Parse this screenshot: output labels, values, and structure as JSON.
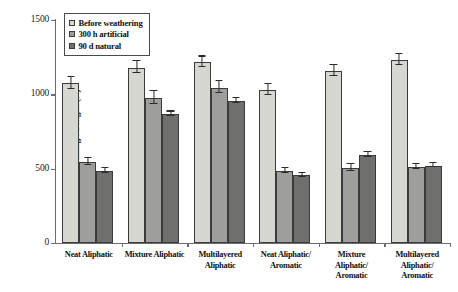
{
  "chart_data": {
    "type": "bar",
    "title": "",
    "xlabel": "",
    "ylabel": "Breaking strength (N)",
    "ylim": [
      0,
      1500
    ],
    "yticks": [
      0,
      500,
      1000,
      1500
    ],
    "grid": false,
    "legend_position": "top-left",
    "categories": [
      "Neat Aliphatic",
      "Mixture Aliphatic",
      "Multilayered Aliphatic",
      "Neat Aliphatic/ Aromatic",
      "Mixture Aliphatic/ Aromatic",
      "Multilayered Aliphatic/ Aromatic"
    ],
    "series": [
      {
        "name": "Before weathering",
        "color": "#d7d7d2",
        "values": [
          1075,
          1180,
          1215,
          1030,
          1155,
          1230
        ],
        "errors": [
          45,
          45,
          40,
          40,
          40,
          40
        ]
      },
      {
        "name": "300 h artificial",
        "color": "#9e9e9b",
        "values": [
          545,
          975,
          1045,
          485,
          505,
          510
        ],
        "errors": [
          30,
          50,
          45,
          20,
          25,
          20
        ]
      },
      {
        "name": "90 d natural",
        "color": "#6f6f6d",
        "values": [
          485,
          865,
          955,
          455,
          590,
          520
        ],
        "errors": [
          20,
          20,
          20,
          15,
          20,
          15
        ]
      }
    ]
  },
  "legend": {
    "items": [
      {
        "label": "Before weathering",
        "swatch": "#d7d7d2"
      },
      {
        "label": "300 h artificial",
        "swatch": "#9e9e9b"
      },
      {
        "label": "90 d natural",
        "swatch": "#6f6f6d"
      }
    ]
  },
  "axis": {
    "y_title": "Breaking strength (N)",
    "y_tick_labels": [
      "0",
      "500",
      "1000",
      "1500"
    ]
  },
  "xlabels": [
    [
      "Neat Aliphatic"
    ],
    [
      "Mixture Aliphatic"
    ],
    [
      "Multilayered",
      "Aliphatic"
    ],
    [
      "Neat Aliphatic/",
      "Aromatic"
    ],
    [
      "Mixture",
      "Aliphatic/",
      "Aromatic"
    ],
    [
      "Multilayered",
      "Aliphatic/",
      "Aromatic"
    ]
  ]
}
